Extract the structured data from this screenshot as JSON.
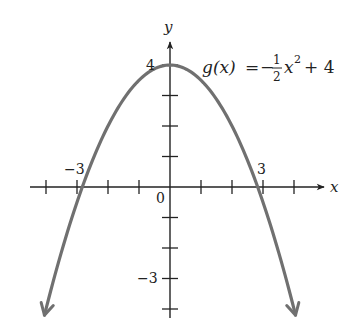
{
  "chart_data": {
    "type": "line",
    "title": "",
    "function_label": {
      "name": "g(x)",
      "equals": "=",
      "sign": "−",
      "numerator": "1",
      "denominator": "2",
      "var": "x",
      "exponent": "2",
      "constant": "+ 4"
    },
    "expression": "g(x) = -1/2 x^2 + 4",
    "xlabel": "x",
    "ylabel": "y",
    "origin_label": "0",
    "x_tick_labels": [
      {
        "value": -3,
        "text": "−3"
      },
      {
        "value": 3,
        "text": "3"
      }
    ],
    "y_tick_labels": [
      {
        "value": 4,
        "text": "4"
      },
      {
        "value": -3,
        "text": "−3"
      }
    ],
    "x_ticks": [
      -4,
      -3,
      -2,
      -1,
      1,
      2,
      3,
      4
    ],
    "y_ticks": [
      4,
      3,
      2,
      1,
      -1,
      -2,
      -3,
      -4
    ],
    "xlim": [
      -4.5,
      5
    ],
    "ylim": [
      -4.5,
      5
    ],
    "grid": false,
    "series": [
      {
        "name": "g(x)",
        "coefficient": -0.5,
        "constant": 4,
        "domain": [
          -4.05,
          4.05
        ],
        "arrows": true,
        "color": "#707070",
        "points": [
          {
            "x": -4,
            "y": -4
          },
          {
            "x": -3,
            "y": -0.5
          },
          {
            "x": -2,
            "y": 2
          },
          {
            "x": -1,
            "y": 3.5
          },
          {
            "x": 0,
            "y": 4
          },
          {
            "x": 1,
            "y": 3.5
          },
          {
            "x": 2,
            "y": 2
          },
          {
            "x": 3,
            "y": -0.5
          },
          {
            "x": 4,
            "y": -4
          }
        ]
      }
    ]
  },
  "colors": {
    "axis": "#222222",
    "curve": "#707070",
    "text": "#222222"
  }
}
